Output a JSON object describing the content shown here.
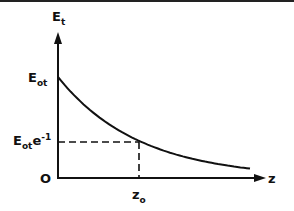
{
  "chart_data": {
    "type": "line",
    "title": "",
    "xlabel": "z",
    "ylabel": "E_t",
    "y_tick_labels": [
      "E_ot",
      "E_ot e^-1",
      "0"
    ],
    "x_tick_labels": [
      "z_o"
    ],
    "annotations": [
      {
        "type": "dashed-horizontal",
        "at": "E_ot e^-1",
        "from_x": 0,
        "to_x": "z_o"
      },
      {
        "type": "dashed-vertical",
        "at": "z_o",
        "from_y": 0,
        "to_y": "E_ot e^-1"
      }
    ],
    "series": [
      {
        "name": "E_t(z)",
        "x": [
          0,
          0.5,
          1,
          1.5,
          2,
          2.5
        ],
        "values": [
          1.0,
          0.607,
          0.368,
          0.223,
          0.135,
          0.082
        ]
      }
    ],
    "xlim": [
      0,
      2.6
    ],
    "ylim": [
      0,
      1.3
    ],
    "grid": false,
    "legend": "none"
  },
  "labels": {
    "y_axis": {
      "main": "E",
      "sub": "t"
    },
    "y_top": {
      "main": "E",
      "sub": "ot"
    },
    "y_mid": {
      "main": "E",
      "sub": "ot",
      "extra": "e",
      "sup": "-1"
    },
    "origin": "O",
    "x_tick": {
      "main": "z",
      "sub": "o"
    },
    "x_axis": "z"
  }
}
